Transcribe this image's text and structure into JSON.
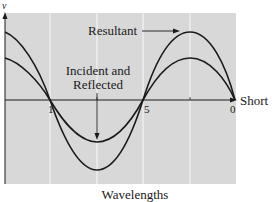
{
  "figure": {
    "y_axis_label": "v",
    "x_axis_end_label": "Short",
    "x_axis_title": "Wavelengths",
    "tick_labels": [
      "1",
      "5",
      "0"
    ],
    "annotations": {
      "resultant": "Resultant",
      "incident_line1": "Incident and",
      "incident_line2": "Reflected"
    },
    "colors": {
      "plot_background": "#d8d8d8",
      "grid_lines": "#f4f4f4",
      "curves": "#1a1a1a",
      "axes": "#1a1a1a"
    }
  }
}
